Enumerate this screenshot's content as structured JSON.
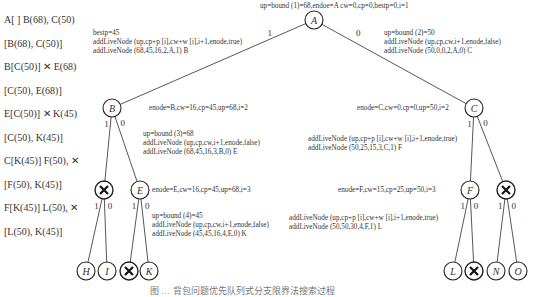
{
  "queue_trace": [
    {
      "text": "A[ ] B(68), C(50)",
      "pruned": false
    },
    {
      "text": "[B(68), C(50)]",
      "pruned": false
    },
    {
      "text": "B[C(50)] ✕ E(68)",
      "pruned": true
    },
    {
      "text": "[C(50), E(68)]",
      "pruned": false
    },
    {
      "text": "E[C(50)] ✕ K(45)",
      "pruned": true
    },
    {
      "text": "[C(50), K(45)]",
      "pruned": false
    },
    {
      "text": "C[K(45)] F(50), ✕",
      "pruned": true
    },
    {
      "text": "[F(50), K(45)]",
      "pruned": false
    },
    {
      "text": "F[K(45)] L(50), ✕",
      "pruned": true
    },
    {
      "text": "[L(50), K(45)]",
      "pruned": false
    }
  ],
  "annotations": {
    "root": "up=bound (1)=68,endoe=A cw=0,cp=0,bestp=0,i=1",
    "a_left": [
      "bestp=45",
      "addLiveNode (up,cp+p [i],cw+w [i],i+1,enode,true)",
      "addLiveNode (68,45,16,2,A,1) B"
    ],
    "a_right": [
      "up=bound (2)=50",
      "addLiveNode (up,cp,cw,i+1,enode,false)",
      "addLiveNode (50,0,0,2,A,0) C"
    ],
    "b_state": "enode=B,cw=16,cp=45,up=68,i=2",
    "b_right": [
      "up=bound (3)=68",
      "addLiveNode (up,cp,cw,i+1,enode,false)",
      "addLiveNode (68,45,16,3,B,0) E"
    ],
    "c_state": "enode=C,cw=0,cp=0,up=50,i=2",
    "c_left": [
      "addLiveNode (up,cp+p [i],cw+w [i],i+1,enode,true)",
      "addLiveNode (50,25,15,3,C,1) F"
    ],
    "e_state": "enode=E,cw=16,cp=45,up=68,i=3",
    "e_right": [
      "up=bound (4)=45",
      "addLiveNode (up,cp,cw,i+1,enode,false)",
      "addLiveNode (45,45,16,4,E,0) K"
    ],
    "f_state": "enode=F,cw=15,cp=25,up=50,i=3",
    "f_left": [
      "addLiveNode (up,cp+p [i],cw+w [i],i+1,enode,true)",
      "addLiveNode (50,50,30,4,F,1) L"
    ]
  },
  "nodes": [
    {
      "id": "A",
      "label": "A",
      "x": 314,
      "y": 20,
      "pruned": false
    },
    {
      "id": "B",
      "label": "B",
      "x": 112,
      "y": 108,
      "pruned": false
    },
    {
      "id": "C",
      "label": "C",
      "x": 474,
      "y": 108,
      "pruned": false
    },
    {
      "id": "D",
      "label": "",
      "x": 104,
      "y": 190,
      "pruned": true
    },
    {
      "id": "E",
      "label": "E",
      "x": 140,
      "y": 190,
      "pruned": false
    },
    {
      "id": "F",
      "label": "F",
      "x": 470,
      "y": 190,
      "pruned": false
    },
    {
      "id": "G",
      "label": "",
      "x": 506,
      "y": 190,
      "pruned": true
    },
    {
      "id": "H",
      "label": "H",
      "x": 86,
      "y": 271,
      "pruned": false
    },
    {
      "id": "I",
      "label": "I",
      "x": 107,
      "y": 271,
      "pruned": false
    },
    {
      "id": "J",
      "label": "",
      "x": 129,
      "y": 271,
      "pruned": true
    },
    {
      "id": "K",
      "label": "K",
      "x": 149,
      "y": 271,
      "pruned": false
    },
    {
      "id": "L",
      "label": "L",
      "x": 453,
      "y": 271,
      "pruned": false
    },
    {
      "id": "M",
      "label": "",
      "x": 474,
      "y": 271,
      "pruned": true
    },
    {
      "id": "N",
      "label": "N",
      "x": 496,
      "y": 271,
      "pruned": false
    },
    {
      "id": "O",
      "label": "O",
      "x": 518,
      "y": 271,
      "pruned": false
    }
  ],
  "edges": [
    {
      "from": "A",
      "to": "B",
      "label": "1"
    },
    {
      "from": "A",
      "to": "C",
      "label": "0"
    },
    {
      "from": "B",
      "to": "D",
      "label": "1"
    },
    {
      "from": "B",
      "to": "E",
      "label": "0"
    },
    {
      "from": "C",
      "to": "F",
      "label": "1"
    },
    {
      "from": "C",
      "to": "G",
      "label": "0"
    },
    {
      "from": "D",
      "to": "H",
      "label": "1"
    },
    {
      "from": "D",
      "to": "I",
      "label": "0"
    },
    {
      "from": "E",
      "to": "J",
      "label": "1"
    },
    {
      "from": "E",
      "to": "K",
      "label": "0"
    },
    {
      "from": "F",
      "to": "L",
      "label": "1"
    },
    {
      "from": "F",
      "to": "M",
      "label": "0"
    },
    {
      "from": "G",
      "to": "N",
      "label": "1"
    },
    {
      "from": "G",
      "to": "O",
      "label": "0"
    }
  ],
  "caption": "图 … 背包问题优先队列式分支限界法搜索过程"
}
